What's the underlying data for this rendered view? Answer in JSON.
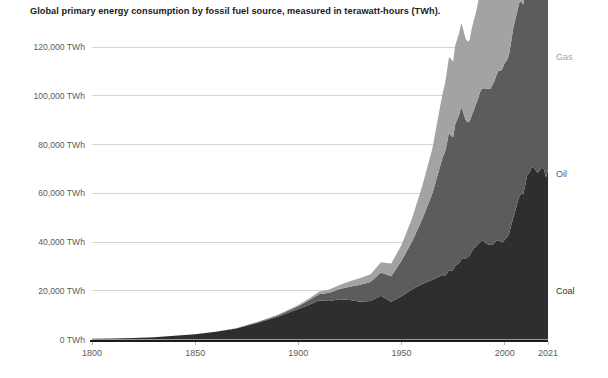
{
  "chart_data": {
    "type": "area",
    "stacked": true,
    "title": "Global primary energy consumption by fossil fuel source, measured in terawatt-hours (TWh).",
    "xlabel": "",
    "ylabel": "",
    "xlim": [
      1800,
      2021
    ],
    "ylim": [
      0,
      132000
    ],
    "grid": true,
    "legend_position": "right-inline",
    "x_ticks": [
      "1800",
      "1850",
      "1900",
      "1950",
      "2000",
      "2021"
    ],
    "x_tick_values": [
      1800,
      1850,
      1900,
      1950,
      2000,
      2021
    ],
    "y_ticks": [
      "0 TWh",
      "20,000 TWh",
      "40,000 TWh",
      "60,000 TWh",
      "80,000 TWh",
      "100,000 TWh",
      "120,000 TWh"
    ],
    "y_tick_values": [
      0,
      20000,
      40000,
      60000,
      80000,
      100000,
      120000
    ],
    "colors": {
      "coal": "#2e2e2e",
      "oil": "#5c5c5c",
      "gas": "#a3a3a3",
      "axis": "#1b1b1b",
      "grid": "#d5d5d5",
      "tick_text": "#5b5b5b",
      "title_text": "#1b1b1b"
    },
    "x": [
      1800,
      1810,
      1820,
      1830,
      1840,
      1850,
      1860,
      1870,
      1880,
      1890,
      1900,
      1905,
      1910,
      1915,
      1920,
      1925,
      1930,
      1935,
      1940,
      1945,
      1950,
      1955,
      1960,
      1965,
      1970,
      1971,
      1972,
      1973,
      1974,
      1975,
      1976,
      1977,
      1978,
      1979,
      1980,
      1981,
      1982,
      1983,
      1984,
      1985,
      1986,
      1987,
      1988,
      1989,
      1990,
      1991,
      1992,
      1993,
      1994,
      1995,
      1996,
      1997,
      1998,
      1999,
      2000,
      2001,
      2002,
      2003,
      2004,
      2005,
      2006,
      2007,
      2008,
      2009,
      2010,
      2011,
      2012,
      2013,
      2014,
      2015,
      2016,
      2017,
      2018,
      2019,
      2020,
      2021
    ],
    "series": [
      {
        "name": "Coal",
        "label": "Coal",
        "color": "#2e2e2e",
        "values": [
          271,
          400,
          600,
          900,
          1500,
          2200,
          3200,
          4500,
          6800,
          9300,
          12500,
          14200,
          16000,
          15800,
          16500,
          16200,
          15500,
          15800,
          18000,
          15500,
          17800,
          20500,
          22800,
          24500,
          26500,
          26200,
          27000,
          28500,
          28200,
          28500,
          30200,
          30800,
          31500,
          33000,
          33500,
          33200,
          33800,
          34500,
          36000,
          37500,
          38000,
          39000,
          40000,
          40500,
          40200,
          39500,
          39000,
          38800,
          38900,
          39500,
          40500,
          40800,
          40200,
          39800,
          41000,
          41800,
          43000,
          46500,
          49500,
          52500,
          55500,
          58500,
          60000,
          59500,
          63500,
          67500,
          68500,
          70500,
          70800,
          69500,
          68500,
          69500,
          70500,
          70000,
          66500,
          70000
        ]
      },
      {
        "name": "Oil",
        "label": "Oil",
        "color": "#5c5c5c",
        "values": [
          0,
          0,
          0,
          0,
          0,
          0,
          30,
          120,
          300,
          600,
          1200,
          1800,
          2600,
          3400,
          4200,
          5500,
          7000,
          7800,
          9500,
          10500,
          14500,
          19500,
          26500,
          35500,
          48500,
          50500,
          53500,
          56500,
          55500,
          54500,
          58000,
          59500,
          61000,
          62500,
          59500,
          57000,
          55500,
          55000,
          56000,
          56500,
          58500,
          59500,
          61500,
          62500,
          63000,
          63500,
          64000,
          64000,
          65500,
          66500,
          68000,
          69500,
          70000,
          71500,
          72500,
          72800,
          73500,
          75000,
          77500,
          78500,
          79000,
          79500,
          79000,
          78000,
          80000,
          80500,
          81500,
          82500,
          83500,
          85000,
          86500,
          88000,
          89000,
          89500,
          82500,
          88500
        ]
      },
      {
        "name": "Gas",
        "label": "Gas",
        "color": "#a3a3a3",
        "values": [
          0,
          0,
          0,
          0,
          0,
          0,
          0,
          30,
          100,
          250,
          500,
          700,
          1000,
          1300,
          1700,
          2200,
          2800,
          3200,
          4200,
          5200,
          6500,
          9500,
          13500,
          18500,
          26500,
          28000,
          29500,
          31000,
          31500,
          31000,
          32500,
          33000,
          33500,
          34500,
          34000,
          33500,
          33000,
          33500,
          35500,
          37000,
          37500,
          39500,
          41500,
          43000,
          44000,
          45000,
          45500,
          46500,
          47000,
          48500,
          51000,
          51500,
          52000,
          53500,
          55500,
          56500,
          58500,
          60000,
          62000,
          63500,
          64500,
          67000,
          68000,
          66500,
          71500,
          73500,
          75000,
          76500,
          77000,
          77500,
          79500,
          82000,
          85000,
          86500,
          85000,
          90000
        ]
      }
    ],
    "series_label_positions": [
      {
        "name": "Gas",
        "y_value": 116000
      },
      {
        "name": "Oil",
        "y_value": 68000
      },
      {
        "name": "Coal",
        "y_value": 20000
      }
    ]
  }
}
